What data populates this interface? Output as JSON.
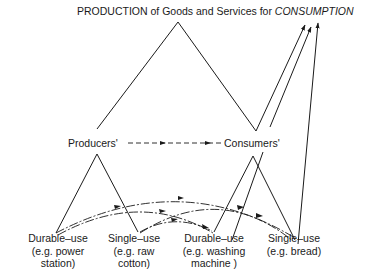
{
  "title": {
    "prefix": "PRODUCTION of Goods and Services for ",
    "emphasis": "CONSUMPTION"
  },
  "middle_nodes": {
    "producers": "Producers'",
    "consumers": "Consumers'"
  },
  "bottom_nodes": [
    {
      "line1": "Durable–use",
      "line2": "(e.g. power",
      "line3": "station)"
    },
    {
      "line1": "Single–use",
      "line2": "(e.g. raw",
      "line3": "cotton)"
    },
    {
      "line1": "Durable–use",
      "line2": "(e.g. washing",
      "line3": "machine )"
    },
    {
      "line1": "Single–use",
      "line2": "(e.g. bread)",
      "line3": ""
    }
  ],
  "colors": {
    "ink": "#1a1a1a",
    "background": "#ffffff"
  }
}
